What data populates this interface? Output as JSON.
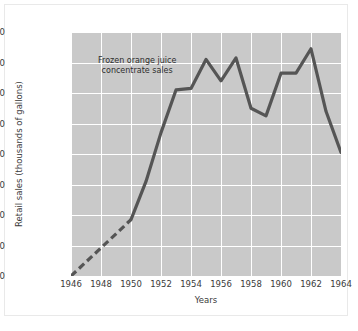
{
  "chart_data": {
    "type": "line",
    "title": "",
    "annotation": "Frozen orange juice\nconcentrate sales",
    "xlabel": "Years",
    "ylabel": "Retail sales (thousands of gallons)",
    "xlim": [
      1946,
      1964
    ],
    "ylim": [
      0,
      80000
    ],
    "xticks": [
      1946,
      1948,
      1950,
      1952,
      1954,
      1956,
      1958,
      1960,
      1962,
      1964
    ],
    "xtick_labels": [
      "1946",
      "1948",
      "1950",
      "1952",
      "1954",
      "1956",
      "1958",
      "1960",
      "1962",
      "1964"
    ],
    "yticks": [
      0,
      10000,
      20000,
      30000,
      40000,
      50000,
      60000,
      70000,
      80000
    ],
    "ytick_labels": [
      "0",
      "10,000",
      "20,000",
      "30,000",
      "40,000",
      "50,000",
      "60,000",
      "70,000",
      "80,000"
    ],
    "grid": true,
    "legend": "none",
    "plot_bgcolor": "#c9c9c9",
    "grid_color": "#ffffff",
    "line_color": "#555555",
    "x": [
      1946,
      1947,
      1948,
      1949,
      1950,
      1951,
      1952,
      1953,
      1954,
      1955,
      1956,
      1957,
      1958,
      1959,
      1960,
      1961,
      1962,
      1963,
      1964
    ],
    "values": [
      0,
      4600,
      9200,
      13800,
      18500,
      31000,
      47000,
      61000,
      61500,
      71000,
      64000,
      71500,
      55000,
      52500,
      66500,
      66500,
      74500,
      54000,
      40500
    ],
    "series": [
      {
        "name": "Frozen orange juice concentrate sales",
        "style": "dashed-then-solid",
        "dashed_range": [
          1946,
          1950
        ],
        "values": [
          0,
          4600,
          9200,
          13800,
          18500,
          31000,
          47000,
          61000,
          61500,
          71000,
          64000,
          71500,
          55000,
          52500,
          66500,
          66500,
          74500,
          54000,
          40500
        ]
      }
    ]
  }
}
